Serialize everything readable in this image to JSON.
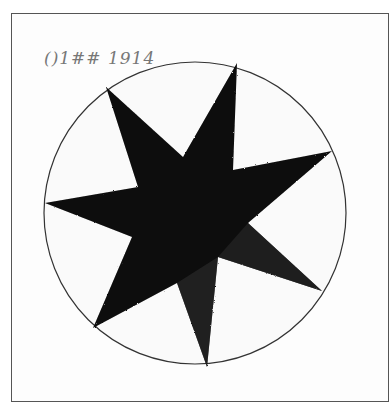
{
  "image": {
    "description": "Scanned child's drawing: a seven-pointed black star inside a circle, inside a rectangular border",
    "handwriting": "()1## 1914",
    "colors": {
      "background": "#ffffff",
      "star": "#0a0a0a",
      "circle_line": "#333333",
      "frame": "#555555"
    },
    "star": {
      "points": 7,
      "vertices": [
        [
          237,
          63
        ],
        [
          233,
          170
        ],
        [
          332,
          151
        ],
        [
          248,
          223
        ],
        [
          322,
          291
        ],
        [
          218,
          257
        ],
        [
          207,
          367
        ],
        [
          177,
          283
        ],
        [
          93,
          328
        ],
        [
          132,
          237
        ],
        [
          45,
          203
        ],
        [
          138,
          187
        ],
        [
          106,
          87
        ],
        [
          183,
          157
        ]
      ]
    },
    "circle": {
      "cx": 195,
      "cy": 213,
      "r": 151
    }
  }
}
